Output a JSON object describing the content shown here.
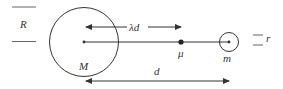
{
  "diagram": {
    "type": "physics-two-body-diagram",
    "colors": {
      "stroke": "#333333",
      "background": "#ffffff"
    },
    "bodies": [
      {
        "name": "large-mass",
        "label": "M",
        "radius_label": "R"
      },
      {
        "name": "small-mass",
        "label": "m",
        "radius_label": "r"
      }
    ],
    "point": {
      "name": "reduced-mass-point",
      "label": "μ"
    },
    "distances": [
      {
        "name": "lambda-d",
        "label": "λd"
      },
      {
        "name": "separation-d",
        "label": "d"
      }
    ]
  },
  "labels": {
    "R": "R",
    "r": "r",
    "M": "M",
    "m": "m",
    "mu": "μ",
    "lambda_d": "λd",
    "d": "d"
  }
}
